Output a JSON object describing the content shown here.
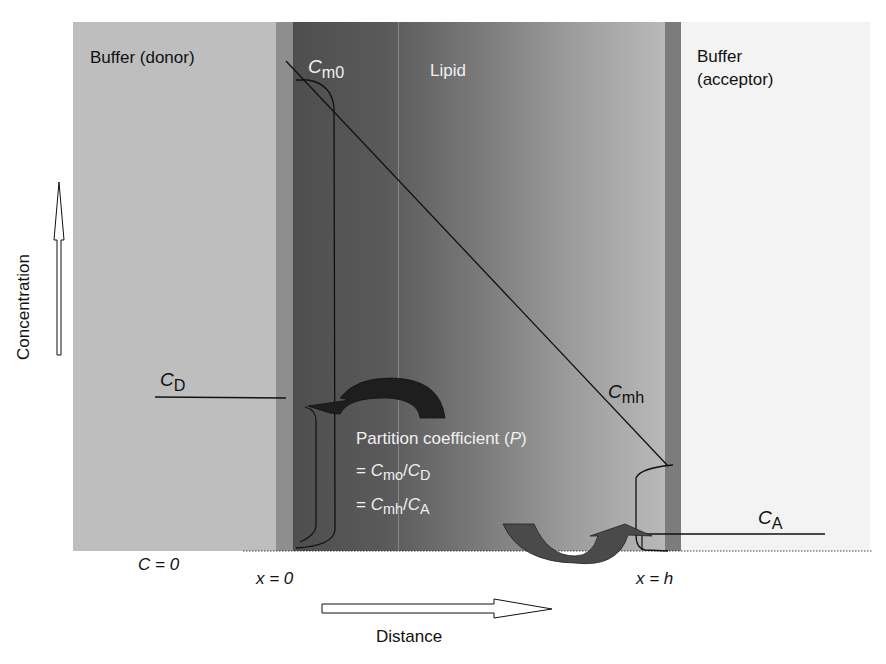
{
  "figure": {
    "regions": [
      {
        "id": "donor",
        "label": "Buffer (donor)",
        "color": "#bebebe"
      },
      {
        "id": "membrane-left",
        "color": "#8e8e8e"
      },
      {
        "id": "lipid",
        "label": "Lipid",
        "gradient_from": "#4e4e4e",
        "gradient_to": "#b9b9b9"
      },
      {
        "id": "membrane-right",
        "color": "#7c7c7c"
      },
      {
        "id": "acceptor",
        "label_line1": "Buffer",
        "label_line2": "(acceptor)",
        "color": "#f3f3f3"
      }
    ],
    "labels": {
      "donor": "Buffer (donor)",
      "lipid": "Lipid",
      "acceptor_line1": "Buffer",
      "acceptor_line2": "(acceptor)",
      "cm0_main": "C",
      "cm0_sub": "m0",
      "cmh_main": "C",
      "cmh_sub": "mh",
      "cd_main": "C",
      "cd_sub": "D",
      "ca_main": "C",
      "ca_sub": "A",
      "c_zero": "C = 0",
      "x_zero": "x = 0",
      "x_h": "x = h",
      "y_axis": "Concentration",
      "x_axis": "Distance"
    },
    "partition": {
      "line1_text": "Partition coefficient (",
      "line1_var": "P",
      "line1_close": ")",
      "line2_eq": "= ",
      "line2_num_main": "C",
      "line2_num_sub": "mo",
      "line2_slash": "/",
      "line2_den_main": "C",
      "line2_den_sub": "D",
      "line3_eq": "= ",
      "line3_num_main": "C",
      "line3_num_sub": "mh",
      "line3_slash": "/",
      "line3_den_main": "C",
      "line3_den_sub": "A"
    },
    "colors": {
      "line": "#111111",
      "arrow_dark": "#2a2a2a",
      "arrow_mid": "#555555",
      "text_on_dark": "#f0f0f0"
    }
  }
}
